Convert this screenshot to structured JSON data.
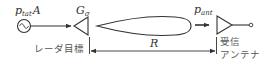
{
  "diagram": {
    "source": {
      "symbol": "p",
      "subscript": "tat",
      "suffix": "A",
      "icon": "ac-source-icon"
    },
    "target": {
      "gain_symbol": "G",
      "gain_subscript": "σ",
      "label": "レーダ目標"
    },
    "received": {
      "symbol": "p",
      "subscript": "ant"
    },
    "receiver": {
      "label_line1": "受信",
      "label_line2": "アンテナ"
    },
    "distance": {
      "symbol": "R"
    },
    "colors": {
      "ink": "#333333",
      "label_gray": "#555555"
    }
  }
}
